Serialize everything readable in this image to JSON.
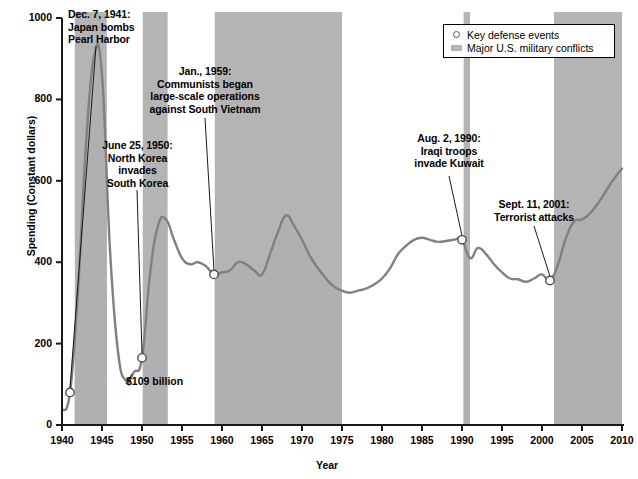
{
  "chart_data": {
    "type": "area",
    "title": "",
    "xlabel": "Year",
    "ylabel": "Spending (Constant dollars)",
    "xlim": [
      1940,
      2010
    ],
    "ylim": [
      0,
      1000
    ],
    "xticks": [
      1940,
      1945,
      1950,
      1955,
      1960,
      1965,
      1970,
      1975,
      1980,
      1985,
      1990,
      1995,
      2000,
      2005,
      2010
    ],
    "yticks": [
      0,
      200,
      400,
      600,
      800,
      1000
    ],
    "grid": false,
    "legend_position": "top-right",
    "series": [
      {
        "name": "U.S. defense spending (constant dollars, billions)",
        "x": [
          1940,
          1941,
          1942,
          1943,
          1944,
          1945,
          1946,
          1947,
          1948,
          1949,
          1950,
          1951,
          1952,
          1953,
          1954,
          1955,
          1956,
          1957,
          1958,
          1959,
          1960,
          1961,
          1962,
          1963,
          1964,
          1965,
          1966,
          1967,
          1968,
          1969,
          1970,
          1971,
          1972,
          1973,
          1974,
          1975,
          1976,
          1977,
          1978,
          1979,
          1980,
          1981,
          1982,
          1983,
          1984,
          1985,
          1986,
          1987,
          1988,
          1989,
          1990,
          1991,
          1992,
          1993,
          1994,
          1995,
          1996,
          1997,
          1998,
          1999,
          2000,
          2001,
          2002,
          2003,
          2004,
          2005,
          2006,
          2007,
          2008,
          2009,
          2010
        ],
        "y": [
          35,
          80,
          330,
          690,
          905,
          860,
          430,
          180,
          109,
          130,
          165,
          370,
          490,
          505,
          455,
          410,
          395,
          400,
          390,
          370,
          375,
          380,
          400,
          395,
          380,
          370,
          420,
          475,
          515,
          490,
          455,
          415,
          385,
          360,
          340,
          330,
          325,
          330,
          335,
          345,
          360,
          385,
          420,
          440,
          455,
          460,
          455,
          450,
          452,
          455,
          455,
          410,
          435,
          420,
          395,
          375,
          360,
          358,
          352,
          360,
          370,
          355,
          395,
          460,
          500,
          505,
          520,
          545,
          575,
          605,
          630
        ]
      }
    ],
    "legend": [
      {
        "label": "Key defense events",
        "marker": "open-circle"
      },
      {
        "label": "Major U.S. military conflicts",
        "marker": "gray-band"
      }
    ],
    "conflict_bands": [
      {
        "name": "World War II",
        "start": 1941.6,
        "end": 1945.6
      },
      {
        "name": "Korean War",
        "start": 1950.1,
        "end": 1953.2
      },
      {
        "name": "Vietnam War",
        "start": 1959.1,
        "end": 1975.0
      },
      {
        "name": "Gulf War",
        "start": 1990.2,
        "end": 1991.0
      },
      {
        "name": "Afghanistan and Iraq Wars",
        "start": 2001.5,
        "end": 2010.0
      }
    ],
    "events": [
      {
        "year": 1941,
        "value": 80,
        "label": "Dec. 7, 1941: Japan bombs Pearl Harbor"
      },
      {
        "year": 1950,
        "value": 165,
        "label": "June 25, 1950: North Korea invades South Korea"
      },
      {
        "year": 1959,
        "value": 370,
        "label": "Jan., 1959: Communists began large-scale operations against South Vietnam"
      },
      {
        "year": 1990,
        "value": 455,
        "label": "Aug. 2, 1990: Iraqi troops invade Kuwait"
      },
      {
        "year": 2001,
        "value": 355,
        "label": "Sept. 11, 2001: Terrorist attacks"
      }
    ],
    "annotations": [
      {
        "id": "pearl-harbor",
        "lines": [
          "Dec. 7, 1941:",
          "Japan bombs",
          "Pearl Harbor"
        ],
        "target_year": 1941,
        "target_value": 80
      },
      {
        "id": "korea",
        "lines": [
          "June 25, 1950:",
          "North Korea",
          "invades",
          "South Korea"
        ],
        "target_year": 1950,
        "target_value": 165
      },
      {
        "id": "vietnam",
        "lines": [
          "Jan., 1959:",
          "Communists began",
          "large-scale operations",
          "against South Vietnam"
        ],
        "target_year": 1959,
        "target_value": 370
      },
      {
        "id": "kuwait",
        "lines": [
          "Aug. 2, 1990:",
          "Iraqi troops",
          "invade Kuwait"
        ],
        "target_year": 1990,
        "target_value": 455
      },
      {
        "id": "sept-11",
        "lines": [
          "Sept. 11, 2001:",
          "Terrorist attacks"
        ],
        "target_year": 2001,
        "target_value": 355
      }
    ],
    "value_callouts": [
      {
        "id": "low-point",
        "text": "$109 billion",
        "year": 1948,
        "value": 109
      }
    ],
    "colors": {
      "band": "#b4b4b4",
      "area": "#b0b0b0",
      "line": "#808080",
      "axis": "#1a1a1a",
      "text": "#000000",
      "background": "#ffffff"
    }
  },
  "axes": {
    "x": {
      "label": "Year",
      "ticks": [
        "1940",
        "1945",
        "1950",
        "1955",
        "1960",
        "1965",
        "1970",
        "1975",
        "1980",
        "1985",
        "1990",
        "1995",
        "2000",
        "2005",
        "2010"
      ]
    },
    "y": {
      "label": "Spending (Constant dollars)",
      "ticks": [
        "0",
        "200",
        "400",
        "600",
        "800",
        "1000"
      ]
    }
  },
  "legend": {
    "events_label": "Key defense events",
    "conflicts_label": "Major U.S. military conflicts"
  },
  "annotations_text": {
    "pearl_harbor": {
      "l1": "Dec. 7, 1941:",
      "l2": "Japan bombs",
      "l3": "Pearl Harbor"
    },
    "korea": {
      "l1": "June 25, 1950:",
      "l2": "North Korea",
      "l3": "invades",
      "l4": "South Korea"
    },
    "vietnam": {
      "l1": "Jan., 1959:",
      "l2": "Communists began",
      "l3": "large-scale operations",
      "l4": "against South Vietnam"
    },
    "kuwait": {
      "l1": "Aug. 2, 1990:",
      "l2": "Iraqi troops",
      "l3": "invade Kuwait"
    },
    "sept11": {
      "l1": "Sept. 11, 2001:",
      "l2": "Terrorist attacks"
    },
    "low_point": "$109 billion"
  }
}
